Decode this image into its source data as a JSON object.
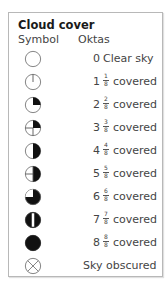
{
  "legend": {
    "title": "Cloud cover",
    "headers": {
      "symbol": "Symbol",
      "oktas": "Oktas"
    },
    "rows": [
      {
        "okta": "0",
        "num": "",
        "den": "",
        "label": "Clear sky",
        "symbol": "clear-sky-circle-icon"
      },
      {
        "okta": "1",
        "num": "1",
        "den": "8",
        "label": "covered",
        "symbol": "one-okta-icon"
      },
      {
        "okta": "2",
        "num": "2",
        "den": "8",
        "label": "covered",
        "symbol": "two-okta-icon"
      },
      {
        "okta": "3",
        "num": "3",
        "den": "8",
        "label": "covered",
        "symbol": "three-okta-icon"
      },
      {
        "okta": "4",
        "num": "4",
        "den": "8",
        "label": "covered",
        "symbol": "four-okta-icon"
      },
      {
        "okta": "5",
        "num": "5",
        "den": "8",
        "label": "covered",
        "symbol": "five-okta-icon"
      },
      {
        "okta": "6",
        "num": "6",
        "den": "8",
        "label": "covered",
        "symbol": "six-okta-icon"
      },
      {
        "okta": "7",
        "num": "7",
        "den": "8",
        "label": "covered",
        "symbol": "seven-okta-icon"
      },
      {
        "okta": "8",
        "num": "8",
        "den": "8",
        "label": "covered",
        "symbol": "eight-okta-icon"
      },
      {
        "okta": "",
        "num": "",
        "den": "",
        "label": "Sky obscured",
        "symbol": "sky-obscured-icon"
      }
    ]
  },
  "colors": {
    "border": "#b8b8b8",
    "fill": "#111111",
    "stroke": "#666666"
  }
}
